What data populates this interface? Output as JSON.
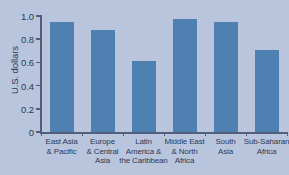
{
  "chart_data": {
    "type": "bar",
    "title": "",
    "xlabel": "",
    "ylabel": "U.S. dollars",
    "ylim": [
      0,
      1.0
    ],
    "ytick_labels": [
      "1.0",
      "0.8",
      "0.6",
      "0.4",
      "0.2",
      "0"
    ],
    "ytick_values": [
      1.0,
      0.8,
      0.6,
      0.4,
      0.2,
      0
    ],
    "grid": false,
    "legend": false,
    "bar_color": "#4e80b2",
    "background_color": "#b9c5dd",
    "axis_color": "#52607e",
    "categories": [
      "East Asia\n& Pacific",
      "Europe\n& Central\nAsia",
      "Latin\nAmerica &\nthe Caribbean",
      "Middle East\n& North\nAfrica",
      "South\nAsia",
      "Sub-Saharan\nAfrica"
    ],
    "category_lines": [
      [
        "East Asia",
        "& Pacific"
      ],
      [
        "Europe",
        "& Central",
        "Asia"
      ],
      [
        "Latin",
        "America &",
        "the Caribbean"
      ],
      [
        "Middle East",
        "& North",
        "Africa"
      ],
      [
        "South",
        "Asia"
      ],
      [
        "Sub-Saharan",
        "Africa"
      ]
    ],
    "values": [
      0.95,
      0.88,
      0.61,
      0.97,
      0.95,
      0.71
    ]
  }
}
